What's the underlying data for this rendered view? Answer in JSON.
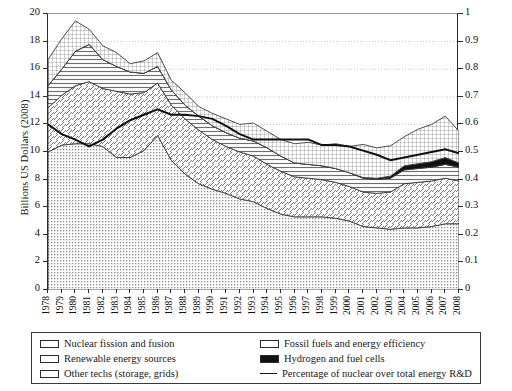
{
  "chart_data": {
    "type": "area",
    "title": "",
    "subtitle": "",
    "xlabel": "",
    "ylabel": "Billions US Dollars (2008)",
    "y2label": "Percentage of Nuclear R&D over Total Energy Public R&D",
    "ylim": [
      0,
      20
    ],
    "y2lim": [
      0,
      1
    ],
    "grid": true,
    "legend_position": "bottom",
    "stacked": true,
    "categories": [
      1978,
      1979,
      1980,
      1981,
      1982,
      1983,
      1984,
      1985,
      1986,
      1987,
      1988,
      1989,
      1990,
      1991,
      1992,
      1993,
      1994,
      1995,
      1996,
      1997,
      1998,
      1999,
      2000,
      2001,
      2002,
      2003,
      2004,
      2005,
      2006,
      2007,
      2008
    ],
    "ytick_labels": [
      "0",
      "2",
      "4",
      "6",
      "8",
      "10",
      "12",
      "14",
      "16",
      "18",
      "20"
    ],
    "y2tick_labels": [
      "0",
      "0.1",
      "0.2",
      "0.3",
      "0.4",
      "0.5",
      "0.6",
      "0.7",
      "0.8",
      "0.9",
      "1"
    ],
    "xtick_labels": [
      "1978",
      "1979",
      "1980",
      "1981",
      "1982",
      "1983",
      "1984",
      "1985",
      "1986",
      "1987",
      "1988",
      "1989",
      "1990",
      "1991",
      "1992",
      "1993",
      "1994",
      "1995",
      "1996",
      "1997",
      "1998",
      "1999",
      "2000",
      "2001",
      "2002",
      "2003",
      "2004",
      "2005",
      "2006",
      "2007",
      "2008"
    ],
    "series": [
      {
        "name": "Other techs (storage, grids)",
        "pattern": "dotted",
        "order": 1,
        "values": [
          10.0,
          10.5,
          10.6,
          10.6,
          10.4,
          9.6,
          9.6,
          10.1,
          11.2,
          9.4,
          8.4,
          7.7,
          7.3,
          7.0,
          6.6,
          6.4,
          5.9,
          5.5,
          5.3,
          5.3,
          5.3,
          5.2,
          5.0,
          4.6,
          4.5,
          4.4,
          4.5,
          4.5,
          4.6,
          4.8,
          4.8
        ]
      },
      {
        "name": "Nuclear fission and fusion",
        "pattern": "diagonal-hatch",
        "order": 2,
        "values": [
          3.2,
          3.6,
          4.2,
          4.5,
          4.2,
          4.8,
          4.6,
          4.2,
          3.8,
          4.0,
          4.0,
          3.9,
          3.6,
          3.4,
          3.4,
          3.3,
          3.2,
          3.1,
          2.9,
          2.8,
          2.7,
          2.6,
          2.5,
          2.5,
          2.5,
          2.7,
          3.2,
          3.3,
          3.3,
          3.3,
          3.1
        ]
      },
      {
        "name": "Renewable energy sources",
        "pattern": "horizontal-lines",
        "order": 3,
        "values": [
          1.6,
          1.9,
          2.5,
          2.7,
          2.1,
          1.8,
          1.6,
          1.4,
          1.2,
          1.1,
          1.0,
          1.0,
          1.0,
          1.0,
          1.0,
          1.1,
          1.2,
          1.1,
          1.0,
          1.0,
          1.0,
          1.0,
          1.0,
          1.0,
          1.0,
          1.0,
          1.0,
          1.0,
          1.0,
          1.0,
          1.0
        ]
      },
      {
        "name": "Hydrogen and fuel cells",
        "pattern": "solid-black",
        "order": 4,
        "values": [
          0,
          0,
          0,
          0,
          0,
          0,
          0,
          0,
          0,
          0,
          0,
          0,
          0,
          0,
          0,
          0,
          0,
          0,
          0,
          0,
          0,
          0,
          0,
          0.05,
          0.1,
          0.15,
          0.3,
          0.35,
          0.4,
          0.5,
          0.3
        ]
      },
      {
        "name": "Fossil fuels and energy efficiency",
        "pattern": "grid-crosshatch",
        "order": 5,
        "values": [
          1.9,
          2.2,
          2.2,
          1.1,
          1.0,
          1.0,
          0.6,
          0.9,
          1.0,
          0.7,
          0.9,
          0.7,
          0.9,
          1.0,
          1.0,
          1.3,
          1.2,
          1.2,
          1.4,
          1.6,
          1.5,
          1.8,
          1.9,
          2.4,
          2.2,
          2.2,
          2.1,
          2.5,
          2.7,
          3.0,
          2.3
        ]
      }
    ],
    "line_series": {
      "name": "Percentage of nuclear over total energy R&D",
      "axis": "right",
      "color": "#111111",
      "values": [
        0.6,
        0.565,
        0.545,
        0.52,
        0.545,
        0.585,
        0.615,
        0.635,
        0.655,
        0.635,
        0.635,
        0.63,
        0.62,
        0.595,
        0.565,
        0.545,
        0.545,
        0.545,
        0.545,
        0.545,
        0.525,
        0.525,
        0.52,
        0.505,
        0.49,
        0.47,
        0.48,
        0.49,
        0.5,
        0.51,
        0.495
      ]
    }
  },
  "legend": {
    "items": [
      {
        "label": "Nuclear fission and fusion",
        "pattern": "diagonal-hatch"
      },
      {
        "label": "Renewable energy sources",
        "pattern": "horizontal-lines"
      },
      {
        "label": "Other techs (storage, grids)",
        "pattern": "dotted"
      },
      {
        "label": "Fossil fuels and energy efficiency",
        "pattern": "grid-crosshatch"
      },
      {
        "label": "Hydrogen and fuel cells",
        "pattern": "solid-black"
      },
      {
        "label": "Percentage of nuclear over total energy R&D",
        "pattern": "line"
      }
    ]
  }
}
